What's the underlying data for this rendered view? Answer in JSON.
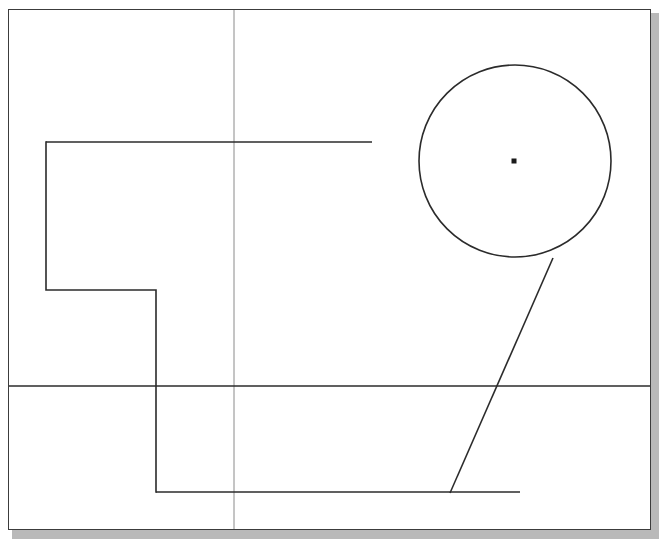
{
  "app": {
    "title": "CAD Drawing Canvas",
    "canvas_width": 671,
    "canvas_height": 550,
    "background_color": "#ffffff",
    "sheet_color": "#ffffff",
    "shadow_color": "#b9b9b9",
    "line_color": "#2b2b2b",
    "border_color": "#3c3c3c",
    "construction_color": "#8a8a8a"
  },
  "sheet": {
    "label": "drawing-sheet",
    "x": 8,
    "y": 9,
    "width": 643,
    "height": 521
  },
  "shadow": {
    "label": "sheet-shadow",
    "x": 12,
    "y": 13,
    "width": 647,
    "height": 526
  },
  "geometry": {
    "construction_lines": [
      {
        "name": "vertical-construction-line",
        "orientation": "vertical",
        "x1": 234,
        "y1": 10,
        "x2": 234,
        "y2": 529,
        "stroke": "#8a8a8a",
        "width": 1
      }
    ],
    "datum_lines": [
      {
        "name": "horizontal-datum-line",
        "orientation": "horizontal",
        "x1": 9,
        "y1": 386,
        "x2": 650,
        "y2": 386,
        "stroke": "#2b2b2b",
        "width": 1.4
      },
      {
        "name": "upper-horizontal-line",
        "orientation": "horizontal",
        "x1": 46,
        "y1": 142,
        "x2": 372,
        "y2": 142,
        "stroke": "#2b2b2b",
        "width": 1.4
      },
      {
        "name": "lower-horizontal-line",
        "orientation": "horizontal",
        "x1": 156,
        "y1": 492,
        "x2": 520,
        "y2": 492,
        "stroke": "#2b2b2b",
        "width": 1.4
      }
    ],
    "stepped_polyline": {
      "name": "stepped-profile-polyline",
      "points": "46,142 46,290 156,290 156,492",
      "stroke": "#2b2b2b",
      "width": 1.6,
      "vertex_count": 4
    },
    "circle": {
      "name": "main-circle",
      "cx": 515,
      "cy": 161,
      "r": 96,
      "diameter": 192,
      "stroke": "#2b2b2b",
      "width": 1.6,
      "fill": "none"
    },
    "circle_center_mark": {
      "name": "circle-center-point",
      "cx": 514,
      "cy": 161,
      "size": 5,
      "fill": "#1a1a1a"
    },
    "tangent_line": {
      "name": "tangent-diagonal-line",
      "x1": 553,
      "y1": 258,
      "x2": 450,
      "y2": 493,
      "stroke": "#2b2b2b",
      "width": 1.6
    }
  }
}
